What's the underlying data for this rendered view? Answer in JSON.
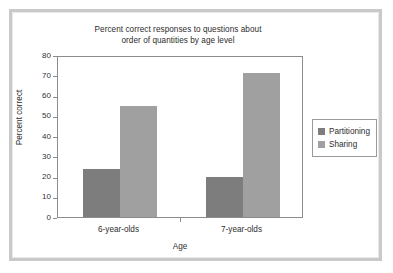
{
  "figure": {
    "frame_color": "#c9c9c9",
    "background": "#ffffff"
  },
  "chart_data": {
    "type": "bar",
    "title": "Percent correct responses to questions about order of quantities by age level",
    "title_lines": [
      "Percent correct responses to questions about",
      "order of quantities by age level"
    ],
    "xlabel": "Age",
    "ylabel": "Percent correct",
    "categories": [
      "6-year-olds",
      "7-year-olds"
    ],
    "series": [
      {
        "name": "Partitioning",
        "color": "#7d7d7d",
        "values": [
          23.5,
          20
        ]
      },
      {
        "name": "Sharing",
        "color": "#a0a0a0",
        "values": [
          55,
          71
        ]
      }
    ],
    "ylim": [
      0,
      80
    ],
    "yticks": [
      0,
      10,
      20,
      30,
      40,
      50,
      60,
      70,
      80
    ],
    "ytick_labels": [
      "0",
      "10",
      "20",
      "30",
      "40",
      "50",
      "60",
      "70",
      "80"
    ],
    "grid": false,
    "legend_position": "right"
  },
  "legend": {
    "entries": [
      {
        "label": "Partitioning",
        "color": "#7d7d7d"
      },
      {
        "label": "Sharing",
        "color": "#a0a0a0"
      }
    ]
  }
}
